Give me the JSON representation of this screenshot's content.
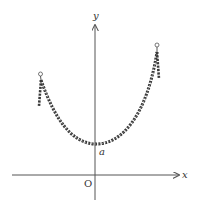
{
  "diagram": {
    "labels": {
      "x_axis": "x",
      "y_axis": "y",
      "origin": "O",
      "min_point": "a"
    },
    "colors": {
      "axis": "#555555",
      "chain": "#3a3a3a",
      "background": "#ffffff"
    }
  }
}
